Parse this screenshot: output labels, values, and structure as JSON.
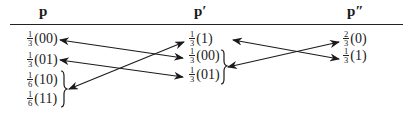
{
  "columns": [
    {
      "id": "p",
      "header": "p",
      "entries": [
        {
          "num": "1",
          "den": "3",
          "label": "(00)"
        },
        {
          "num": "1",
          "den": "3",
          "label": "(01)"
        },
        {
          "num": "1",
          "den": "6",
          "label": "(10)"
        },
        {
          "num": "1",
          "den": "6",
          "label": "(11)"
        }
      ]
    },
    {
      "id": "p_prime",
      "header": "p′",
      "entries": [
        {
          "num": "1",
          "den": "3",
          "label": "(1)"
        },
        {
          "num": "1",
          "den": "3",
          "label": "(00)"
        },
        {
          "num": "1",
          "den": "3",
          "label": "(01)"
        }
      ]
    },
    {
      "id": "p_double_prime",
      "header": "p″",
      "entries": [
        {
          "num": "2",
          "den": "3",
          "label": "(0)"
        },
        {
          "num": "1",
          "den": "3",
          "label": "(1)"
        }
      ]
    }
  ],
  "braces": [
    {
      "column": "p",
      "groups": [
        "(10)",
        "(11)"
      ]
    },
    {
      "column": "p_prime",
      "groups": [
        "(00)",
        "(01)"
      ]
    }
  ],
  "mappings": [
    {
      "from": "p:(00)",
      "to": "p′:(00)",
      "type": "double-arrow"
    },
    {
      "from": "p:(01)",
      "to": "p′:(01)",
      "type": "double-arrow"
    },
    {
      "from": "p:{(10),(11)}",
      "to": "p′:(1)",
      "type": "double-arrow"
    },
    {
      "from": "p′:(1)",
      "to": "p″:(1)",
      "type": "double-arrow"
    },
    {
      "from": "p′:{(00),(01)}",
      "to": "p″:(0)",
      "type": "double-arrow"
    }
  ],
  "colors": {
    "ink": "#1a1a1a",
    "background": "#ffffff"
  }
}
